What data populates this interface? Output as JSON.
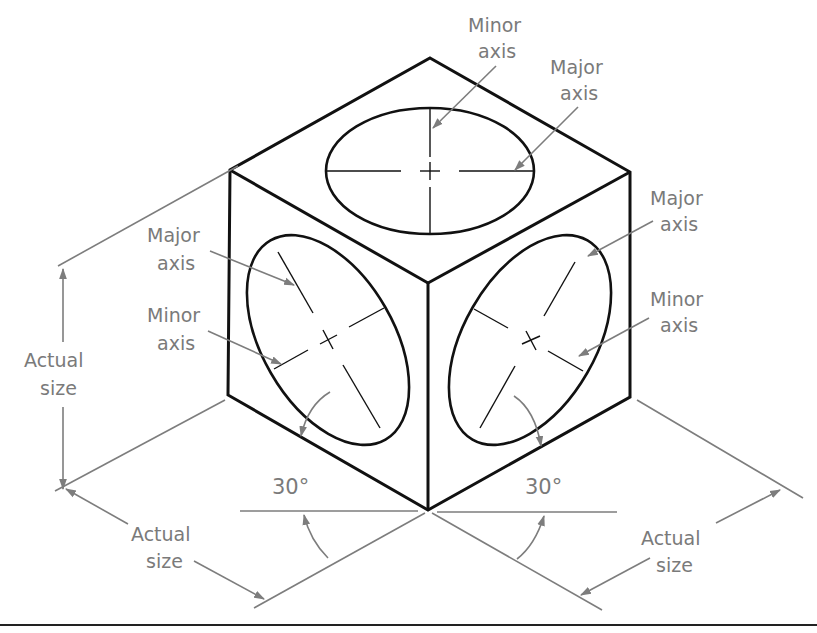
{
  "figure": {
    "type": "isometric cube with isometric circles (ellipses) on three faces",
    "colors": {
      "object_lines": "#111111",
      "annotation_lines": "#7d7d7d",
      "annotation_text": "#7a7a7a",
      "background": "#ffffff"
    },
    "labels": {
      "top_minor": {
        "line1": "Minor",
        "line2": "axis"
      },
      "top_major": {
        "line1": "Major",
        "line2": "axis"
      },
      "left_major": {
        "line1": "Major",
        "line2": "axis"
      },
      "left_minor": {
        "line1": "Minor",
        "line2": "axis"
      },
      "right_major": {
        "line1": "Major",
        "line2": "axis"
      },
      "right_minor": {
        "line1": "Minor",
        "line2": "axis"
      },
      "height_dim": {
        "line1": "Actual",
        "line2": "size"
      },
      "left_width_dim": {
        "line1": "Actual",
        "line2": "size"
      },
      "right_width_dim": {
        "line1": "Actual",
        "line2": "size"
      },
      "angle_left": "30°",
      "angle_right": "30°"
    }
  }
}
